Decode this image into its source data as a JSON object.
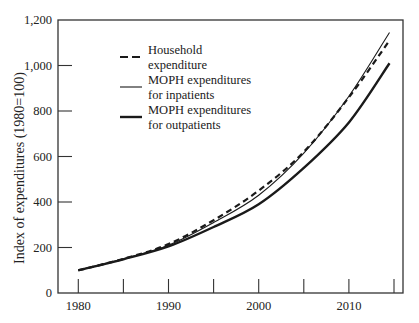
{
  "chart_data": {
    "type": "line",
    "title": "",
    "xlabel": "",
    "ylabel": "Index of expenditures (1980=100)",
    "x": [
      1980,
      1985,
      1990,
      1995,
      2000,
      2005,
      2010,
      2015
    ],
    "xlim": [
      1978.5,
      2016
    ],
    "ylim": [
      0,
      1200
    ],
    "x_ticks": [
      1980,
      1985,
      1990,
      1995,
      2000,
      2005,
      2010,
      2015
    ],
    "x_tick_labels": [
      "1980",
      "",
      "1990",
      "",
      "2000",
      "",
      "2010",
      ""
    ],
    "y_ticks": [
      0,
      200,
      400,
      600,
      800,
      1000,
      1200
    ],
    "y_tick_labels": [
      "0",
      "200",
      "400",
      "600",
      "800",
      "1,000",
      "1,200"
    ],
    "grid": false,
    "legend_position": "upper left (inside plot)",
    "series": [
      {
        "name": "Household expenditure",
        "style": "dashed",
        "stroke_width": 2.2,
        "values": [
          100,
          150,
          215,
          320,
          450,
          620,
          860,
          1110
        ]
      },
      {
        "name": "MOPH expenditures for inpatients",
        "style": "solid-thin",
        "stroke_width": 1.1,
        "values": [
          100,
          150,
          210,
          310,
          430,
          615,
          865,
          1145
        ]
      },
      {
        "name": "MOPH expenditures for outpatients",
        "style": "solid-thick",
        "stroke_width": 2.4,
        "values": [
          100,
          148,
          205,
          290,
          390,
          550,
          750,
          1010
        ]
      }
    ],
    "legend": [
      {
        "lines": [
          "Household",
          "expenditure"
        ],
        "style": "dashed"
      },
      {
        "lines": [
          "MOPH expenditures",
          "for inpatients"
        ],
        "style": "solid-thin"
      },
      {
        "lines": [
          "MOPH expenditures",
          "for outpatients"
        ],
        "style": "solid-thick"
      }
    ]
  },
  "caption_fragment": "...ures in the MOPH and...",
  "colors": {
    "ink": "#1a1a1a",
    "background": "#ffffff"
  }
}
